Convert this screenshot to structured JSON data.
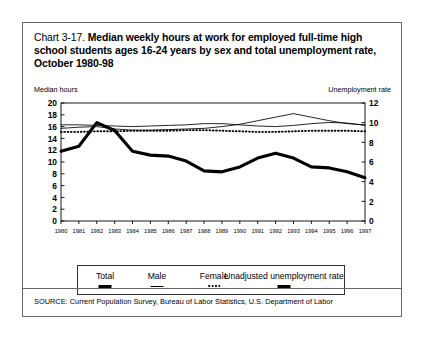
{
  "title": {
    "prefix": "Chart 3-17.",
    "main": "Median weekly hours at work for employed full-time high school students ages 16-24 years by sex and total unemployment rate, October 1980-98"
  },
  "axis_captions": {
    "left": "Median hours",
    "right": "Unemployment rate"
  },
  "legend": {
    "items": [
      {
        "label": "Total",
        "marker": "thick-solid-line"
      },
      {
        "label": "Male",
        "marker": "thin-solid-line"
      },
      {
        "label": "Female",
        "marker": "dotted-line"
      },
      {
        "label": "Unadjusted unemployment rate",
        "marker": "thick-solid-line"
      }
    ]
  },
  "source": {
    "text": "SOURCE: Current Population Survey, Bureau of Labor Statistics, U.S. Department of Labor"
  },
  "chart_data": {
    "type": "line",
    "title": "Chart 3-17. Median weekly hours at work for employed full-time high school students ages 16-24 years by sex and total unemployment rate, October 1980-98",
    "xlabel": "",
    "ylabel": "Median hours",
    "y2label": "Unemployment rate",
    "grid": false,
    "legend_position": "bottom",
    "x": [
      1980,
      1981,
      1982,
      1983,
      1984,
      1985,
      1986,
      1987,
      1988,
      1989,
      1990,
      1991,
      1992,
      1993,
      1994,
      1995,
      1996,
      1997
    ],
    "xticklabels": [
      "1980",
      "1981",
      "1982",
      "1983",
      "1984",
      "1985",
      "1986",
      "1987",
      "1988",
      "1989",
      "1990",
      "1991",
      "1992",
      "1993",
      "1994",
      "1995",
      "1996",
      "1997"
    ],
    "ylim": [
      0,
      20
    ],
    "yticks": [
      0,
      2,
      4,
      6,
      8,
      10,
      12,
      14,
      16,
      18,
      20
    ],
    "y2lim": [
      0,
      12
    ],
    "y2ticks": [
      0,
      2,
      4,
      6,
      8,
      10,
      12
    ],
    "series": [
      {
        "name": "Total",
        "axis": "left",
        "style": "thin-solid",
        "values": [
          15.7,
          15.9,
          16.0,
          15.6,
          15.4,
          15.4,
          15.5,
          15.6,
          15.7,
          16.0,
          16.4,
          17.0,
          17.6,
          18.2,
          17.6,
          17.0,
          16.5,
          16.3
        ]
      },
      {
        "name": "Male",
        "axis": "left",
        "style": "thin-solid",
        "values": [
          16.3,
          16.3,
          16.2,
          16.1,
          16.0,
          16.1,
          16.2,
          16.3,
          16.5,
          16.5,
          16.3,
          16.1,
          16.0,
          16.2,
          16.5,
          16.7,
          16.6,
          16.2
        ]
      },
      {
        "name": "Female",
        "axis": "left",
        "style": "dotted",
        "values": [
          15.1,
          15.1,
          15.2,
          15.2,
          15.3,
          15.3,
          15.3,
          15.4,
          15.4,
          15.3,
          15.2,
          15.1,
          15.1,
          15.2,
          15.3,
          15.3,
          15.3,
          15.2
        ]
      },
      {
        "name": "Unadjusted unemployment rate",
        "axis": "right",
        "style": "thick-solid",
        "values": [
          7.1,
          7.6,
          10.0,
          9.2,
          7.1,
          6.7,
          6.6,
          6.1,
          5.1,
          5.0,
          5.5,
          6.4,
          6.9,
          6.4,
          5.5,
          5.4,
          5.0,
          4.4
        ]
      }
    ]
  }
}
